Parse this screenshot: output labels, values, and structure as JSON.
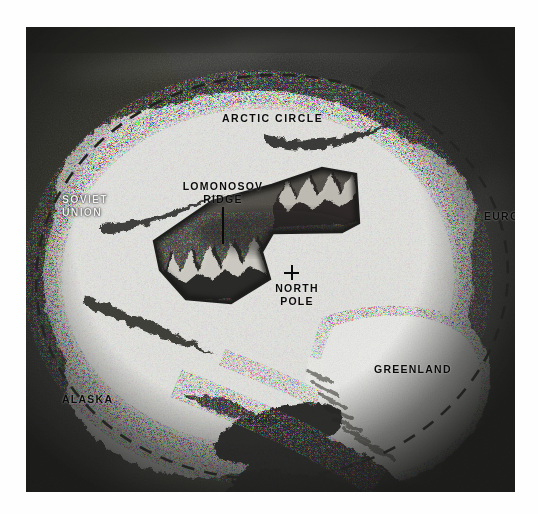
{
  "figure": {
    "kind": "arctic-ocean-ice-cap-cutaway-illustration",
    "medium": "black-and-white halftone photograph of a painted illustration",
    "projection": "polar view centred on the North Pole",
    "border": {
      "photo_bg": "#070707",
      "page_bg": "#ffffff",
      "ink": "#0a0a0a",
      "ice": "#f5f5f2"
    }
  },
  "labels": {
    "arctic_circle": "ARCTIC CIRCLE",
    "soviet_union": "SOVIET\nUNION",
    "europe": "EUROPE",
    "alaska": "ALASKA",
    "canada": "CANADA",
    "greenland": "GREENLAND",
    "lomonosov_ridge": "LOMONOSOV\nRIDGE",
    "north_pole": "NORTH\nPOLE"
  },
  "markers": {
    "north_pole_symbol": "+",
    "ridge_leader_line": "vertical pointer from LOMONOSOV RIDGE label down into the cutaway"
  },
  "features": [
    {
      "name": "arctic-circle-dashed-line",
      "style": "dashed ellipse",
      "encircles": "the whole polar ice cap"
    },
    {
      "name": "polar-ice-cap",
      "style": "bright white crazed / cracked pack-ice texture"
    },
    {
      "name": "seafloor-cutaway",
      "style": "dark wedge-shaped window cut through the ice revealing the ocean floor"
    },
    {
      "name": "lomonosov-ridge",
      "style": "submarine mountain ridge crossing the cutaway"
    },
    {
      "name": "greenland-ice-sheet",
      "style": "white dome fringed with dark stippled mountains"
    }
  ]
}
